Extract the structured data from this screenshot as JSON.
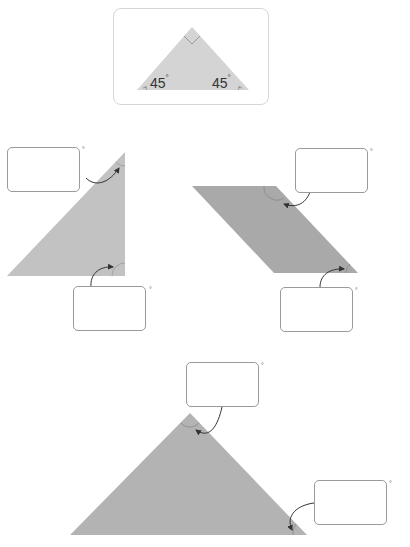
{
  "example_card": {
    "left_angle": "45",
    "right_angle": "45",
    "degree_symbol": "°",
    "right_angle_marker": "square"
  },
  "shapes": [
    {
      "name": "right-triangle",
      "color": "#c2c2c2",
      "answer_boxes": [
        {
          "id": "top-angle",
          "value": "",
          "unit": "°"
        },
        {
          "id": "bottom-right-angle",
          "value": "",
          "unit": "°"
        }
      ]
    },
    {
      "name": "parallelogram",
      "color": "#a9a9a9",
      "answer_boxes": [
        {
          "id": "top-right-angle",
          "value": "",
          "unit": "°"
        },
        {
          "id": "bottom-right-angle",
          "value": "",
          "unit": "°"
        }
      ]
    },
    {
      "name": "isosceles-triangle",
      "color": "#b3b3b3",
      "answer_boxes": [
        {
          "id": "apex-angle",
          "value": "",
          "unit": "°"
        },
        {
          "id": "bottom-right-angle",
          "value": "",
          "unit": "°"
        }
      ]
    }
  ],
  "colors": {
    "card_triangle": "#d4d4d4",
    "box_border": "#9a9a9a",
    "arrow": "#333333"
  }
}
